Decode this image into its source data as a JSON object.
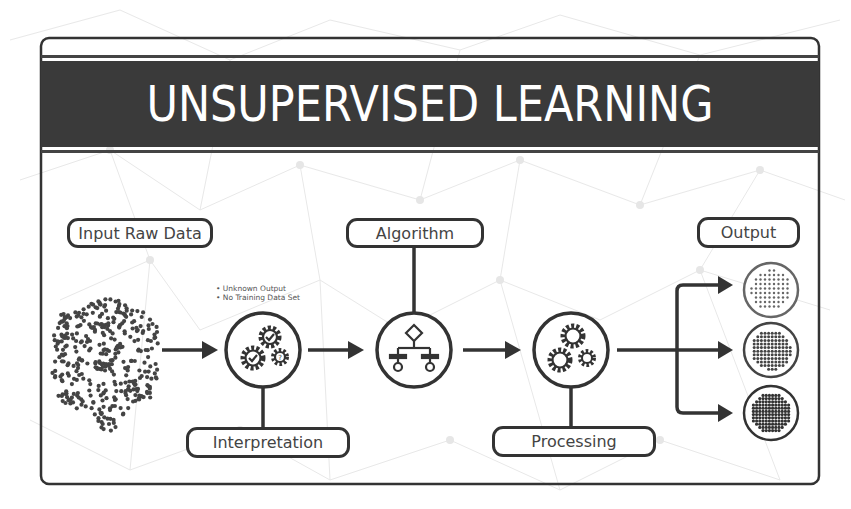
{
  "title": "UNSUPERVISED LEARNING",
  "labels": {
    "input": "Input Raw Data",
    "algorithm": "Algorithm",
    "output": "Output",
    "interpretation": "Interpretation",
    "processing": "Processing"
  },
  "notes": [
    "• Unknown Output",
    "• No Training Data Set"
  ],
  "colors": {
    "ink": "#333333",
    "banner": "#3a3a3a",
    "text_on_banner": "#ffffff",
    "label_text": "#444444",
    "background": "#ffffff",
    "network_lines": "#e6e6e6"
  },
  "flow": [
    "Input Raw Data",
    "Interpretation",
    "Algorithm",
    "Processing",
    "Output"
  ],
  "outputs": [
    {
      "name": "cluster-1",
      "density": "sparse"
    },
    {
      "name": "cluster-2",
      "density": "medium"
    },
    {
      "name": "cluster-3",
      "density": "dense"
    }
  ]
}
